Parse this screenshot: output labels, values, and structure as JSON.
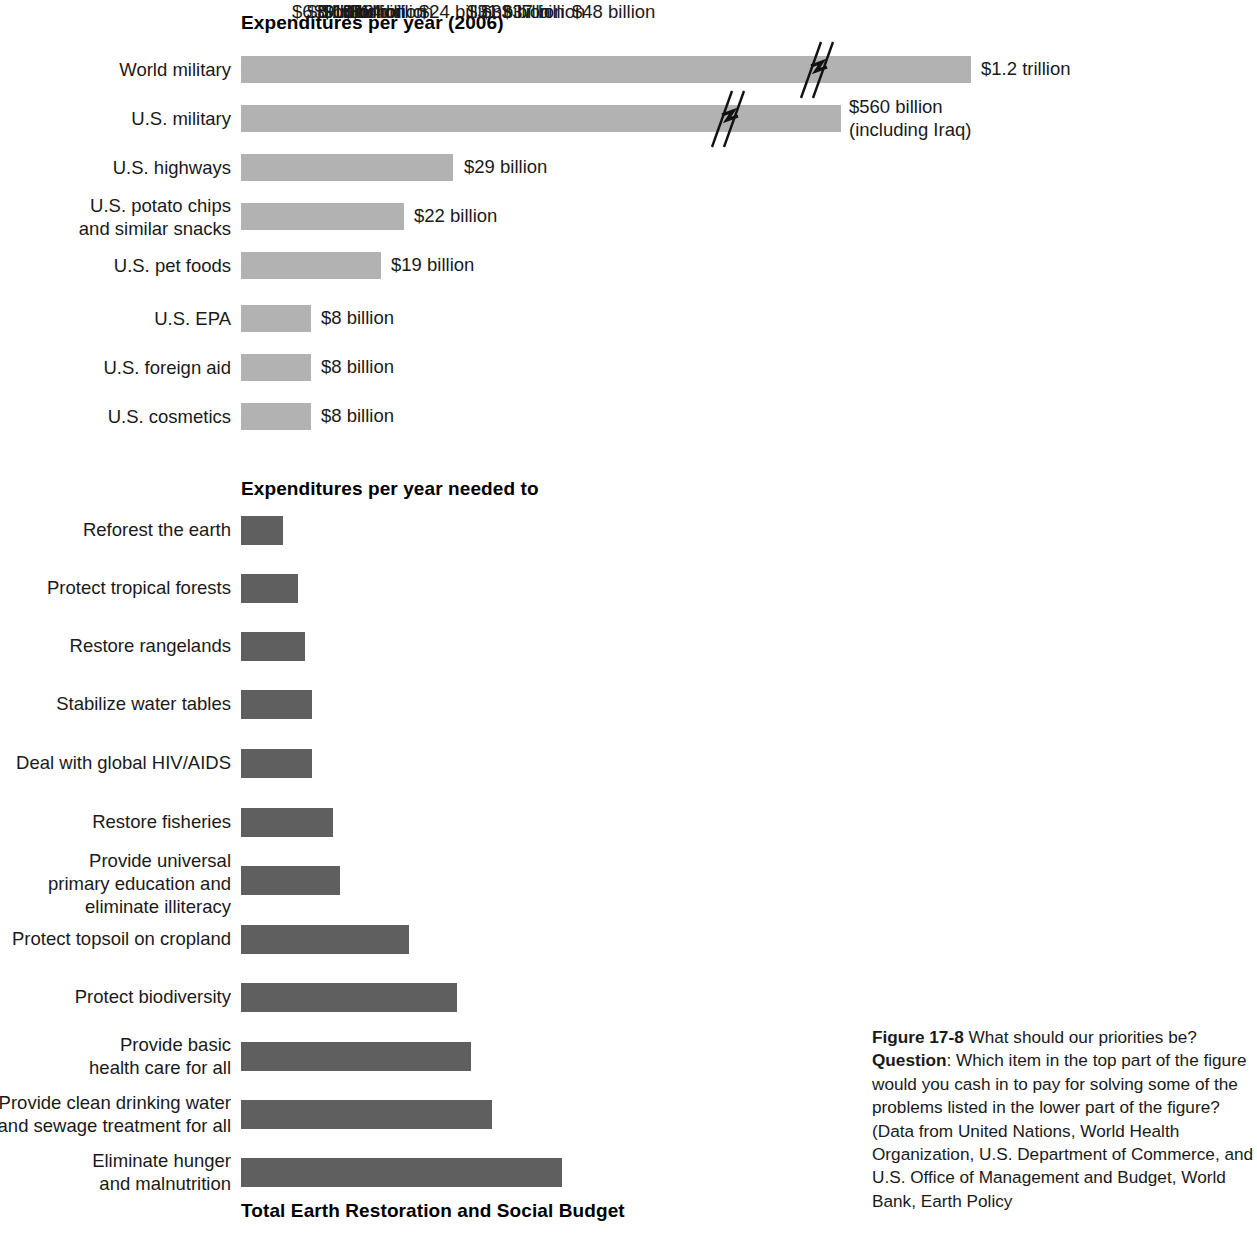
{
  "figure": {
    "top_section_heading": "Expenditures per year (2006)",
    "needed_section_heading": "Expenditures per year needed to",
    "total_heading": "Total Earth Restoration and Social Budget",
    "caption_figure_number": "Figure 17-8",
    "caption_title": " What should our priorities be? ",
    "caption_question_label": "Question",
    "caption_body": ": Which item in the top part of the figure would you cash in to pay for solving some of the problems listed in the lower part of the figure? (Data from United Nations, World Health Organization, U.S. Department of Commerce, and U.S. Office of Management and Budget, World Bank, Earth Policy"
  },
  "colors": {
    "expenditure_bar": "#b2b2b2",
    "needed_bar": "#5f5f5f",
    "text": "#1a1a1a",
    "background": "#ffffff"
  },
  "chart_data": {
    "type": "bar",
    "title": "What should our priorities be?",
    "orientation": "horizontal",
    "xlabel": "",
    "ylabel": "",
    "units": "US dollars per year",
    "grid": false,
    "legend": false,
    "axis_break": true,
    "axis_break_note": "World military and U.S. military bars are truncated with a broken-axis symbol",
    "sections": [
      {
        "name": "Expenditures per year (2006)",
        "bar_color": "#b2b2b2",
        "categories": [
          "World military",
          "U.S. military",
          "U.S. highways",
          "U.S. potato chips and similar snacks",
          "U.S. pet foods",
          "U.S. EPA",
          "U.S. foreign aid",
          "U.S. cosmetics"
        ],
        "values": [
          1200,
          560,
          29,
          22,
          19,
          8,
          8,
          8
        ],
        "value_labels": [
          "$1.2 trillion",
          "$560 billion\n(including Iraq)",
          "$29 billion",
          "$22 billion",
          "$19 billion",
          "$8 billion",
          "$8 billion",
          "$8 billion"
        ]
      },
      {
        "name": "Expenditures per year needed to",
        "bar_color": "#5f5f5f",
        "categories": [
          "Reforest the earth",
          "Protect tropical forests",
          "Restore rangelands",
          "Stabilize water tables",
          "Deal with global HIV/AIDS",
          "Restore fisheries",
          "Provide universal primary education and eliminate illiteracy",
          "Protect topsoil on cropland",
          "Protect biodiversity",
          "Provide basic health care for all",
          "Provide clean drinking water and sewage treatment for all",
          "Eliminate hunger and malnutrition"
        ],
        "values": [
          6,
          8,
          9,
          10,
          10,
          13,
          14,
          24,
          31,
          33,
          37,
          48
        ],
        "value_labels": [
          "$6 billion",
          "$8 billion",
          "$9 billion",
          "$10 billion",
          "$10 billion",
          "$13 billion",
          "$14 billion",
          "$24 billion",
          "$31 billion",
          "$33 billion",
          "$37 billion",
          "$48 billion"
        ]
      }
    ]
  },
  "rows_top": [
    {
      "label": "World military",
      "value_label": "$1.2 trillion",
      "bar_width": 730,
      "y": 56,
      "bar_h": 27,
      "label_y": 58,
      "value_x": 981,
      "value_y": 57,
      "break_x": 795
    },
    {
      "label": "U.S. military",
      "value_label": "$560 billion\n(including Iraq)",
      "bar_width": 600,
      "y": 105,
      "bar_h": 27,
      "label_y": 107,
      "value_x": 849,
      "value_y": 95,
      "break_x": 706
    },
    {
      "label": "U.S. highways",
      "value_label": "$29 billion",
      "bar_width": 212,
      "y": 154,
      "bar_h": 27,
      "label_y": 156,
      "value_x": 464,
      "value_y": 155,
      "break_x": null
    },
    {
      "label": "U.S. potato chips\nand similar snacks",
      "value_label": "$22 billion",
      "bar_width": 163,
      "y": 203,
      "bar_h": 27,
      "label_y": 194,
      "value_x": 414,
      "value_y": 204,
      "break_x": null
    },
    {
      "label": "U.S. pet foods",
      "value_label": "$19 billion",
      "bar_width": 140,
      "y": 252,
      "bar_h": 27,
      "label_y": 254,
      "value_x": 391,
      "value_y": 253,
      "break_x": null
    },
    {
      "label": "U.S. EPA",
      "value_label": "$8 billion",
      "bar_width": 70,
      "y": 305,
      "bar_h": 27,
      "label_y": 307,
      "value_x": 321,
      "value_y": 306,
      "break_x": null
    },
    {
      "label": "U.S. foreign aid",
      "value_label": "$8 billion",
      "bar_width": 70,
      "y": 354,
      "bar_h": 27,
      "label_y": 356,
      "value_x": 321,
      "value_y": 355,
      "break_x": null
    },
    {
      "label": "U.S. cosmetics",
      "value_label": "$8 billion",
      "bar_width": 70,
      "y": 403,
      "bar_h": 27,
      "label_y": 405,
      "value_x": 321,
      "value_y": 404,
      "break_x": null
    }
  ],
  "rows_needed": [
    {
      "label": "Reforest the earth",
      "value_label": "$6 billion",
      "bar_width": 42,
      "y": 516,
      "bar_h": 29,
      "label_y": 518,
      "value_x": 292
    },
    {
      "label": "Protect tropical forests",
      "value_label": "$8 billion",
      "bar_width": 57,
      "y": 574,
      "bar_h": 29,
      "label_y": 576,
      "value_x": 307
    },
    {
      "label": "Restore rangelands",
      "value_label": "$9 billion",
      "bar_width": 64,
      "y": 632,
      "bar_h": 29,
      "label_y": 634,
      "value_x": 314
    },
    {
      "label": "Stabilize water tables",
      "value_label": "$10 billion",
      "bar_width": 71,
      "y": 690,
      "bar_h": 29,
      "label_y": 692,
      "value_x": 322
    },
    {
      "label": "Deal with global HIV/AIDS",
      "value_label": "$10 billion",
      "bar_width": 71,
      "y": 749,
      "bar_h": 29,
      "label_y": 751,
      "value_x": 322
    },
    {
      "label": "Restore fisheries",
      "value_label": "$13 billion",
      "bar_width": 92,
      "y": 808,
      "bar_h": 29,
      "label_y": 810,
      "value_x": 343
    },
    {
      "label": "Provide universal\nprimary education and\neliminate illiteracy",
      "value_label": "$14 billion",
      "bar_width": 99,
      "y": 866,
      "bar_h": 29,
      "label_y": 849,
      "value_x": 350
    },
    {
      "label": "Protect topsoil on cropland",
      "value_label": "$24 billion",
      "bar_width": 168,
      "y": 925,
      "bar_h": 29,
      "label_y": 927,
      "value_x": 419
    },
    {
      "label": "Protect biodiversity",
      "value_label": "$31 billion",
      "bar_width": 216,
      "y": 983,
      "bar_h": 29,
      "label_y": 985,
      "value_x": 467
    },
    {
      "label": "Provide basic\nhealth care for all",
      "value_label": "$33 billion",
      "bar_width": 230,
      "y": 1042,
      "bar_h": 29,
      "label_y": 1033,
      "value_x": 481
    },
    {
      "label": "Provide clean drinking water\nand sewage treatment for all",
      "value_label": "$37 billion",
      "bar_width": 251,
      "y": 1100,
      "bar_h": 29,
      "label_y": 1091,
      "value_x": 502
    },
    {
      "label": "Eliminate hunger\nand malnutrition",
      "value_label": "$48 billion",
      "bar_width": 321,
      "y": 1158,
      "bar_h": 29,
      "label_y": 1149,
      "value_x": 572
    }
  ]
}
